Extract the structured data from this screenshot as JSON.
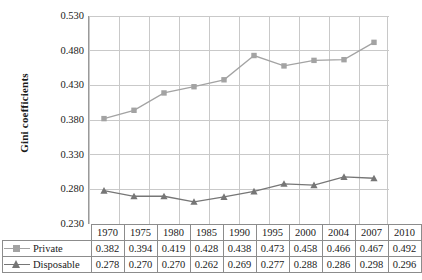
{
  "chart_data": {
    "type": "line",
    "title": "",
    "xlabel": "",
    "ylabel": "Gini coefficients",
    "categories": [
      "1970",
      "1975",
      "1980",
      "1985",
      "1990",
      "1995",
      "2000",
      "2004",
      "2007",
      "2010"
    ],
    "ylim": [
      0.23,
      0.53
    ],
    "yticks": [
      "0.530",
      "0.480",
      "0.430",
      "0.380",
      "0.330",
      "0.280",
      "0.230"
    ],
    "ytick_values": [
      0.53,
      0.48,
      0.43,
      0.38,
      0.33,
      0.28,
      0.23
    ],
    "grid": true,
    "legend_position": "table-left",
    "series": [
      {
        "name": "Private",
        "marker": "square",
        "color": "#a3a3a3",
        "values": [
          0.382,
          0.394,
          0.419,
          0.428,
          0.438,
          0.473,
          0.458,
          0.466,
          0.467,
          0.492
        ],
        "labels": [
          "0.382",
          "0.394",
          "0.419",
          "0.428",
          "0.438",
          "0.473",
          "0.458",
          "0.466",
          "0.467",
          "0.492"
        ]
      },
      {
        "name": "Disposable",
        "marker": "triangle",
        "color": "#767676",
        "values": [
          0.278,
          0.27,
          0.27,
          0.262,
          0.269,
          0.277,
          0.288,
          0.286,
          0.298,
          0.296
        ],
        "labels": [
          "0.278",
          "0.270",
          "0.270",
          "0.262",
          "0.269",
          "0.277",
          "0.288",
          "0.286",
          "0.298",
          "0.296"
        ]
      }
    ]
  },
  "table": {
    "header_blank": "",
    "year_header": [
      "1970",
      "1975",
      "1980",
      "1985",
      "1990",
      "1995",
      "2000",
      "2004",
      "2007",
      "2010"
    ],
    "rows": [
      {
        "label": "Private",
        "values": [
          "0.382",
          "0.394",
          "0.419",
          "0.428",
          "0.438",
          "0.473",
          "0.458",
          "0.466",
          "0.467",
          "0.492"
        ]
      },
      {
        "label": "Disposable",
        "values": [
          "0.278",
          "0.270",
          "0.270",
          "0.262",
          "0.269",
          "0.277",
          "0.288",
          "0.286",
          "0.298",
          "0.296"
        ]
      }
    ]
  },
  "caption": {
    "text": ""
  },
  "colors": {
    "private": "#a3a3a3",
    "disposable": "#767676",
    "grid": "#c9c9c9",
    "axis": "#8c8c8c",
    "text": "#1a1a1a"
  }
}
